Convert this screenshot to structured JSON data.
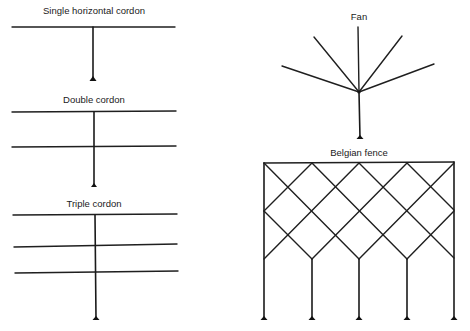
{
  "figure": {
    "panels": [
      {
        "id": "single",
        "label": "Single horizontal cordon"
      },
      {
        "id": "double",
        "label": "Double cordon"
      },
      {
        "id": "triple",
        "label": "Triple cordon"
      },
      {
        "id": "fan",
        "label": "Fan"
      },
      {
        "id": "belgian",
        "label": "Belgian fence"
      }
    ]
  },
  "colors": {
    "line": "#1f1f1f",
    "background": "#ffffff"
  }
}
